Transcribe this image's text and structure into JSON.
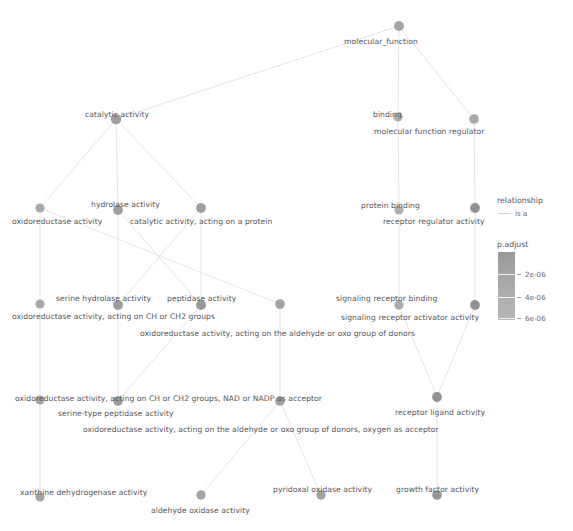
{
  "chart_data": {
    "type": "diagram",
    "title": "",
    "subtitle": "",
    "node_color_metric": "p.adjust",
    "edge_relationship": "is a",
    "nodes": [
      {
        "id": "molecular_function",
        "label": "molecular_function",
        "x": 399,
        "y": 26,
        "r": 5.0,
        "color": "#a5a5a5",
        "label_x": 344,
        "label_y": 37,
        "p_adjust": null
      },
      {
        "id": "catalytic_activity",
        "label": "catalytic activity",
        "x": 116,
        "y": 119,
        "r": 5.2,
        "color": "#9d9d9d",
        "label_x": 85,
        "label_y": 110,
        "p_adjust": null
      },
      {
        "id": "binding",
        "label": "binding",
        "x": 398,
        "y": 117,
        "r": 4.7,
        "color": "#b2b2b2",
        "label_x": 373,
        "label_y": 110,
        "p_adjust": null
      },
      {
        "id": "molecular_function_regulator",
        "label": "molecular function regulator",
        "x": 474,
        "y": 119,
        "r": 4.8,
        "color": "#a8a8a8",
        "label_x": 374,
        "label_y": 127,
        "p_adjust": null
      },
      {
        "id": "oxidoreductase_activity",
        "label": "oxidoreductase activity",
        "x": 40,
        "y": 208,
        "r": 4.6,
        "color": "#a8a8a8",
        "label_x": 12,
        "label_y": 217,
        "p_adjust": null
      },
      {
        "id": "hydrolase_activity",
        "label": "hydrolase activity",
        "x": 118,
        "y": 210,
        "r": 4.9,
        "color": "#9f9f9f",
        "label_x": 91,
        "label_y": 200,
        "p_adjust": null
      },
      {
        "id": "catalytic_activity_protein",
        "label": "catalytic activity, acting on a protein",
        "x": 201,
        "y": 208,
        "r": 4.9,
        "color": "#a0a0a0",
        "label_x": 130,
        "label_y": 217,
        "p_adjust": null
      },
      {
        "id": "protein_binding",
        "label": "protein binding",
        "x": 399,
        "y": 210,
        "r": 4.6,
        "color": "#b0b0b0",
        "label_x": 361,
        "label_y": 201,
        "p_adjust": null
      },
      {
        "id": "receptor_regulator_activity",
        "label": "receptor regulator activity",
        "x": 475,
        "y": 208,
        "r": 4.9,
        "color": "#909090",
        "label_x": 383,
        "label_y": 217,
        "p_adjust": null
      },
      {
        "id": "serine_hydrolase_activity",
        "label": "serine hydrolase activity",
        "x": 118,
        "y": 305,
        "r": 4.9,
        "color": "#9d9d9d",
        "label_x": 56,
        "label_y": 294,
        "p_adjust": null
      },
      {
        "id": "oxidoreductase_CH_CH2",
        "label": "oxidoreductase activity, acting on CH or CH2 groups",
        "x": 40,
        "y": 304,
        "r": 4.6,
        "color": "#a8a8a8",
        "label_x": 12,
        "label_y": 312,
        "p_adjust": null
      },
      {
        "id": "peptidase_activity",
        "label": "peptidase activity",
        "x": 201,
        "y": 305,
        "r": 5.0,
        "color": "#999999",
        "label_x": 167,
        "label_y": 294,
        "p_adjust": null
      },
      {
        "id": "oxidoreductase_aldehyde_oxo",
        "label": "oxidoreductase activity, acting on the aldehyde or oxo group of donors",
        "x": 280,
        "y": 304,
        "r": 4.8,
        "color": "#a3a3a3",
        "label_x": 140,
        "label_y": 329,
        "p_adjust": null
      },
      {
        "id": "signaling_receptor_binding",
        "label": "signaling receptor binding",
        "x": 399,
        "y": 305,
        "r": 4.7,
        "color": "#acacac",
        "label_x": 336,
        "label_y": 294,
        "p_adjust": null
      },
      {
        "id": "signaling_receptor_activator_activity",
        "label": "signaling receptor activator activity",
        "x": 475,
        "y": 305,
        "r": 4.9,
        "color": "#929292",
        "label_x": 341,
        "label_y": 313,
        "p_adjust": null
      },
      {
        "id": "oxidoreductase_CH_CH2_NAD",
        "label": "oxidoreductase activity, acting on CH or CH2 groups, NAD or NADP as acceptor",
        "x": 40,
        "y": 400,
        "r": 4.6,
        "color": "#a6a6a6",
        "label_x": 15,
        "label_y": 394,
        "p_adjust": null
      },
      {
        "id": "serine_type_peptidase_activity",
        "label": "serine-type peptidase activity",
        "x": 118,
        "y": 401,
        "r": 4.8,
        "color": "#9d9d9d",
        "label_x": 58,
        "label_y": 409,
        "p_adjust": null
      },
      {
        "id": "oxidoreductase_aldehyde_oxo_oxygen",
        "label": "oxidoreductase activity, acting on the aldehyde or oxo group of donors, oxygen as acceptor",
        "x": 280,
        "y": 401,
        "r": 4.8,
        "color": "#a0a0a0",
        "label_x": 83,
        "label_y": 425,
        "p_adjust": null
      },
      {
        "id": "receptor_ligand_activity",
        "label": "receptor ligand activity",
        "x": 437,
        "y": 397,
        "r": 4.9,
        "color": "#929292",
        "label_x": 395,
        "label_y": 408,
        "p_adjust": null
      },
      {
        "id": "xanthine_dehydrogenase_activity",
        "label": "xanthine dehydrogenase activity",
        "x": 40,
        "y": 497,
        "r": 4.6,
        "color": "#a5a5a5",
        "label_x": 20,
        "label_y": 488,
        "p_adjust": null
      },
      {
        "id": "aldehyde_oxidase_activity",
        "label": "aldehyde oxidase activity",
        "x": 201,
        "y": 495,
        "r": 4.7,
        "color": "#a3a3a3",
        "label_x": 151,
        "label_y": 506,
        "p_adjust": null
      },
      {
        "id": "pyridoxal_oxidase_activity",
        "label": "pyridoxal oxidase activity",
        "x": 321,
        "y": 495,
        "r": 4.7,
        "color": "#a2a2a2",
        "label_x": 273,
        "label_y": 485,
        "p_adjust": null
      },
      {
        "id": "growth_factor_activity",
        "label": "growth factor activity",
        "x": 437,
        "y": 495,
        "r": 4.8,
        "color": "#969696",
        "label_x": 396,
        "label_y": 485,
        "p_adjust": null
      }
    ],
    "edges": [
      {
        "from": "molecular_function",
        "to": "catalytic_activity",
        "relationship": "is a"
      },
      {
        "from": "molecular_function",
        "to": "binding",
        "relationship": "is a"
      },
      {
        "from": "molecular_function",
        "to": "molecular_function_regulator",
        "relationship": "is a"
      },
      {
        "from": "catalytic_activity",
        "to": "oxidoreductase_activity",
        "relationship": "is a"
      },
      {
        "from": "catalytic_activity",
        "to": "hydrolase_activity",
        "relationship": "is a"
      },
      {
        "from": "catalytic_activity",
        "to": "catalytic_activity_protein",
        "relationship": "is a"
      },
      {
        "from": "binding",
        "to": "protein_binding",
        "relationship": "is a"
      },
      {
        "from": "molecular_function_regulator",
        "to": "receptor_regulator_activity",
        "relationship": "is a"
      },
      {
        "from": "oxidoreductase_activity",
        "to": "oxidoreductase_CH_CH2",
        "relationship": "is a"
      },
      {
        "from": "oxidoreductase_activity",
        "to": "oxidoreductase_aldehyde_oxo",
        "relationship": "is a"
      },
      {
        "from": "hydrolase_activity",
        "to": "serine_hydrolase_activity",
        "relationship": "is a"
      },
      {
        "from": "hydrolase_activity",
        "to": "peptidase_activity",
        "relationship": "is a"
      },
      {
        "from": "catalytic_activity_protein",
        "to": "peptidase_activity",
        "relationship": "is a"
      },
      {
        "from": "catalytic_activity_protein",
        "to": "serine_hydrolase_activity",
        "relationship": "is a"
      },
      {
        "from": "protein_binding",
        "to": "signaling_receptor_binding",
        "relationship": "is a"
      },
      {
        "from": "receptor_regulator_activity",
        "to": "signaling_receptor_activator_activity",
        "relationship": "is a"
      },
      {
        "from": "oxidoreductase_CH_CH2",
        "to": "oxidoreductase_CH_CH2_NAD",
        "relationship": "is a"
      },
      {
        "from": "serine_hydrolase_activity",
        "to": "serine_type_peptidase_activity",
        "relationship": "is a"
      },
      {
        "from": "peptidase_activity",
        "to": "serine_type_peptidase_activity",
        "relationship": "is a"
      },
      {
        "from": "oxidoreductase_aldehyde_oxo",
        "to": "oxidoreductase_aldehyde_oxo_oxygen",
        "relationship": "is a"
      },
      {
        "from": "signaling_receptor_binding",
        "to": "receptor_ligand_activity",
        "relationship": "is a"
      },
      {
        "from": "signaling_receptor_activator_activity",
        "to": "receptor_ligand_activity",
        "relationship": "is a"
      },
      {
        "from": "oxidoreductase_CH_CH2_NAD",
        "to": "xanthine_dehydrogenase_activity",
        "relationship": "is a"
      },
      {
        "from": "oxidoreductase_aldehyde_oxo_oxygen",
        "to": "aldehyde_oxidase_activity",
        "relationship": "is a"
      },
      {
        "from": "oxidoreductase_aldehyde_oxo_oxygen",
        "to": "pyridoxal_oxidase_activity",
        "relationship": "is a"
      },
      {
        "from": "receptor_ligand_activity",
        "to": "growth_factor_activity",
        "relationship": "is a"
      }
    ],
    "legends": [
      {
        "name": "relationship",
        "type": "line",
        "entries": [
          "is a"
        ]
      },
      {
        "name": "p.adjust",
        "type": "colorbar",
        "ticks": [
          "2e-06",
          "4e-06",
          "6e-06"
        ],
        "gradient_top": "#9a9a9a",
        "gradient_bottom": "#b6b6b6"
      }
    ]
  },
  "legend": {
    "relationship_title": "relationship",
    "relationship_entry": "is a",
    "padjust_title": "p.adjust",
    "tick_1": "2e-06",
    "tick_2": "4e-06",
    "tick_3": "6e-06"
  },
  "nodes": {
    "n0": "molecular_function",
    "n1": "catalytic activity",
    "n2": "binding",
    "n3": "molecular function regulator",
    "n4": "oxidoreductase activity",
    "n5": "hydrolase activity",
    "n6": "catalytic activity, acting on a protein",
    "n7": "protein binding",
    "n8": "receptor regulator activity",
    "n9": "serine hydrolase activity",
    "n10": "oxidoreductase activity, acting on CH or CH2 groups",
    "n11": "peptidase activity",
    "n12": "oxidoreductase activity, acting on the aldehyde or oxo group of donors",
    "n13": "signaling receptor binding",
    "n14": "signaling receptor activator activity",
    "n15": "oxidoreductase activity, acting on CH or CH2 groups, NAD or NADP as acceptor",
    "n16": "serine-type peptidase activity",
    "n17": "oxidoreductase activity, acting on the aldehyde or oxo group of donors, oxygen as acceptor",
    "n18": "receptor ligand activity",
    "n19": "xanthine dehydrogenase activity",
    "n20": "aldehyde oxidase activity",
    "n21": "pyridoxal oxidase activity",
    "n22": "growth factor activity"
  }
}
